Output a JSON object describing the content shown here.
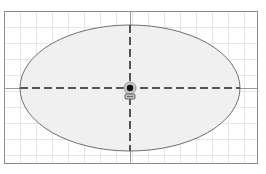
{
  "canvas": {
    "width": 266,
    "height": 174,
    "background": "#ffffff"
  },
  "frame": {
    "x": 4,
    "y": 11,
    "width": 253,
    "height": 152,
    "stroke": "#8c8c8c"
  },
  "grid": {
    "spacing": 16,
    "origin_x": 4,
    "origin_y": 11,
    "color": "#e6e6e6"
  },
  "ellipse": {
    "cx": 130,
    "cy": 88,
    "rx": 110,
    "ry": 63,
    "fill": "#f0f0f0",
    "stroke": "#707070"
  },
  "axes": {
    "horizontal": {
      "y": 88,
      "x1": 4,
      "x2": 257
    },
    "vertical": {
      "x": 130,
      "y1": 11,
      "y2": 163
    },
    "solid_color": "#9a9a9a",
    "dashed_color": "#555555"
  },
  "center_marker": {
    "x": 130,
    "y": 88,
    "dot_color": "#111111",
    "halo_color": "#9a9a9a",
    "icon": "anchor-lock-icon"
  }
}
